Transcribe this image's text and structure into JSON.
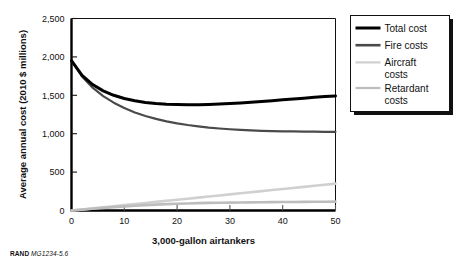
{
  "figure": {
    "credit_prefix": "RAND",
    "credit_id": "MG1234-5.6"
  },
  "chart_data": {
    "type": "line",
    "title": "",
    "xlabel": "3,000-gallon airtankers",
    "ylabel": "Average annual cost (2010 $ millions)",
    "xlim": [
      0,
      50
    ],
    "ylim": [
      0,
      2500
    ],
    "grid": false,
    "legend_position": "outside-right-top",
    "xticks": [
      "0",
      "10",
      "20",
      "30",
      "40",
      "50"
    ],
    "xtick_values": [
      0,
      10,
      20,
      30,
      40,
      50
    ],
    "yticks": [
      "0",
      "500",
      "1,000",
      "1,500",
      "2,000",
      "2,500"
    ],
    "ytick_values": [
      0,
      500,
      1000,
      1500,
      2000,
      2500
    ],
    "x": [
      0,
      2,
      4,
      6,
      8,
      10,
      12,
      14,
      16,
      18,
      20,
      22,
      24,
      26,
      28,
      30,
      32,
      34,
      36,
      38,
      40,
      42,
      44,
      46,
      48,
      50
    ],
    "series": [
      {
        "name": "Total cost",
        "color": "#000000",
        "width": 3.0,
        "values": [
          1950,
          1760,
          1640,
          1558,
          1500,
          1458,
          1428,
          1407,
          1393,
          1384,
          1379,
          1377,
          1378,
          1381,
          1386,
          1392,
          1400,
          1409,
          1419,
          1430,
          1441,
          1452,
          1463,
          1473,
          1483,
          1492
        ]
      },
      {
        "name": "Fire costs",
        "color": "#4a4a4a",
        "width": 2.2,
        "values": [
          1950,
          1745,
          1600,
          1490,
          1404,
          1334,
          1277,
          1231,
          1193,
          1161,
          1135,
          1113,
          1095,
          1080,
          1068,
          1058,
          1050,
          1043,
          1038,
          1034,
          1031,
          1029,
          1027,
          1026,
          1025,
          1025
        ]
      },
      {
        "name": "Aircraft costs",
        "color": "#d0d0d0",
        "width": 2.6,
        "values": [
          0,
          14,
          28,
          42,
          56,
          70,
          84,
          98,
          112,
          126,
          140,
          154,
          168,
          182,
          196,
          210,
          224,
          238,
          252,
          266,
          280,
          294,
          308,
          322,
          336,
          350
        ]
      },
      {
        "name": "Retardant costs",
        "color": "#bdbdbd",
        "width": 2.6,
        "values": [
          0,
          12,
          23,
          34,
          44,
          54,
          62,
          70,
          77,
          83,
          88,
          92,
          96,
          99,
          101,
          103,
          105,
          106,
          108,
          109,
          110,
          111,
          112,
          113,
          114,
          115
        ]
      }
    ],
    "legend": [
      {
        "label": "Total cost",
        "color": "#000000",
        "width": 3.0,
        "lines": [
          "Total cost"
        ]
      },
      {
        "label": "Fire costs",
        "color": "#4a4a4a",
        "width": 2.6,
        "lines": [
          "Fire costs"
        ]
      },
      {
        "label": "Aircraft costs",
        "color": "#d0d0d0",
        "width": 2.2,
        "lines": [
          "Aircraft",
          "costs"
        ]
      },
      {
        "label": "Retardant costs",
        "color": "#bdbdbd",
        "width": 2.2,
        "lines": [
          "Retardant",
          "costs"
        ]
      }
    ]
  }
}
